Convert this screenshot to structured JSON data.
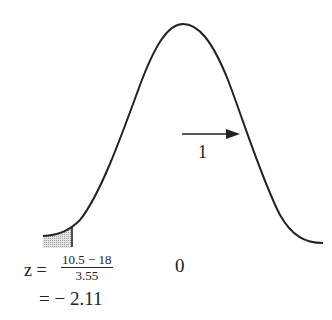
{
  "diagram": {
    "type": "normal-distribution-curve",
    "curve": {
      "color": "#222222",
      "mean_label": "0",
      "sd_arrow_label": "1"
    },
    "shaded_region": {
      "fill": "#c8c8c8",
      "description": "left tail area below z = -2.11"
    },
    "formula": {
      "lhs": "z =",
      "numerator": "10.5 − 18",
      "denominator": "3.55",
      "result": "= − 2.11"
    }
  }
}
